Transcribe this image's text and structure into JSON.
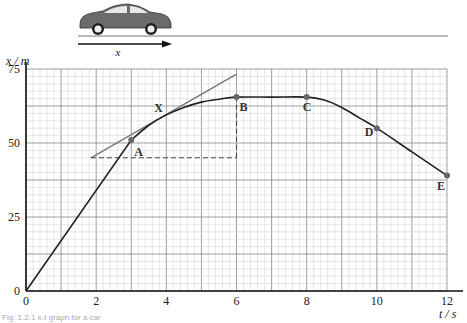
{
  "figure": {
    "caption": "Fig. 1.2.1 x-t graph for a car",
    "car_icon": "car-icon",
    "direction_label": "x"
  },
  "chart_data": {
    "type": "line",
    "title": "",
    "xlabel": "t / s",
    "ylabel": "x / m",
    "xlim": [
      0,
      12
    ],
    "ylim": [
      0,
      75
    ],
    "x_ticks": [
      0,
      2,
      4,
      6,
      8,
      10,
      12
    ],
    "y_ticks": [
      0,
      25,
      50,
      75
    ],
    "grid": true,
    "grid_minor_x": 0.2,
    "grid_minor_y": 2.5,
    "series": [
      {
        "name": "x-t curve",
        "x": [
          0,
          3,
          3.5,
          4,
          4.5,
          5,
          5.5,
          6,
          7,
          8,
          8.5,
          9,
          9.5,
          10,
          11,
          12
        ],
        "y": [
          0,
          51,
          56,
          59.5,
          62,
          63.8,
          64.8,
          65.5,
          65.5,
          65.5,
          64.5,
          62,
          58.5,
          55,
          47,
          39
        ]
      }
    ],
    "points": [
      {
        "label": "A",
        "t": 3,
        "x": 51
      },
      {
        "label": "X",
        "t": 4,
        "x": 59.5
      },
      {
        "label": "B",
        "t": 6,
        "x": 65.5
      },
      {
        "label": "C",
        "t": 8,
        "x": 65.5
      },
      {
        "label": "D",
        "t": 10,
        "x": 55
      },
      {
        "label": "E",
        "t": 12,
        "x": 39
      }
    ],
    "tangent_at_X": {
      "from": {
        "t": 1.85,
        "x": 45
      },
      "to": {
        "t": 6,
        "x": 73.3
      }
    },
    "construction_dashed": [
      {
        "from": {
          "t": 1.85,
          "x": 45
        },
        "to": {
          "t": 6,
          "x": 45
        }
      },
      {
        "from": {
          "t": 6,
          "x": 45
        },
        "to": {
          "t": 6,
          "x": 65.5
        }
      }
    ]
  }
}
